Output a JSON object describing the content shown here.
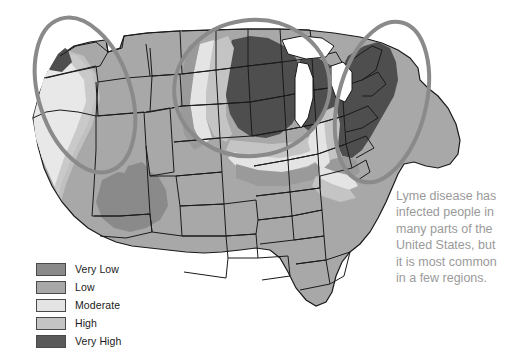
{
  "figure": {
    "background_color": "#ffffff"
  },
  "caption": {
    "lines": [
      "Lyme disease has",
      "infected people in",
      "many parts of the",
      "United States, but",
      "it is most common",
      "in a few regions."
    ],
    "full_text": "Lyme disease has infected people in many parts of the United States, but it is most common in a few regions.",
    "color": "#9a9a9a"
  },
  "legend": {
    "items": [
      {
        "label": "Very Low",
        "color": "#8a8a8a"
      },
      {
        "label": "Low",
        "color": "#a8a8a8"
      },
      {
        "label": "Moderate",
        "color": "#e4e4e4"
      },
      {
        "label": "High",
        "color": "#c4c4c4"
      },
      {
        "label": "Very High",
        "color": "#5a5a5a"
      }
    ]
  },
  "map": {
    "base_fill": "#a8a8a8",
    "border_color": "#1a1a1a",
    "water_fill": "#ffffff",
    "highlight_circle_color": "#8a8a8a",
    "highlight_circle_width": 4,
    "regions": [
      {
        "name": "pacific-northwest-highlight",
        "level": "Very High"
      },
      {
        "name": "upper-midwest-highlight",
        "level": "Very High"
      },
      {
        "name": "northeast-highlight",
        "level": "Very High"
      },
      {
        "name": "four-corners-low-area",
        "level": "Very Low"
      }
    ],
    "circles": [
      {
        "name": "west-coast-circle",
        "cx": 85,
        "cy": 95,
        "rx": 46,
        "ry": 80,
        "rotation": -18
      },
      {
        "name": "upper-midwest-circle",
        "cx": 252,
        "cy": 88,
        "rx": 78,
        "ry": 68,
        "rotation": -8
      },
      {
        "name": "northeast-circle",
        "cx": 382,
        "cy": 102,
        "rx": 44,
        "ry": 82,
        "rotation": 14
      }
    ]
  }
}
